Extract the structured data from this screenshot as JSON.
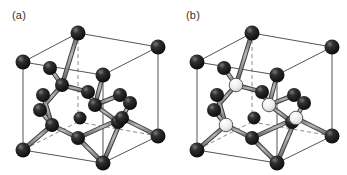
{
  "figure": {
    "type": "crystal-structure-diagram",
    "background_color": "#ffffff",
    "width": 347,
    "height": 175,
    "panels": [
      {
        "id": "a",
        "label": "(a)",
        "structure_name": "diamond cubic",
        "atom_types": [
          "dark"
        ],
        "description": "Conventional cubic unit cell with all atoms identical (dark spheres), four internal tetrahedral-site atoms bonded to corner and face-centre atoms."
      },
      {
        "id": "b",
        "label": "(b)",
        "structure_name": "zincblende",
        "atom_types": [
          "dark",
          "light"
        ],
        "description": "Conventional cubic unit cell with two species; light spheres occupy the four internal tetrahedral sites, dark spheres occupy corners and face centres."
      }
    ]
  },
  "style": {
    "cell_edge_color": "#555555",
    "cell_edge_hidden_color": "#888888",
    "bond_color": "#4a4a4a",
    "bond_fill": "#9a9a9a",
    "atom_dark_color": "#111111",
    "atom_dark_highlight": "#666666",
    "atom_light_color": "#e8e8e8",
    "atom_light_edge": "#4a4a4a",
    "label_color": "#333333"
  },
  "geometry": {
    "cube_vertices": {
      "front_bottom_left": [
        23,
        150
      ],
      "front_bottom_right": [
        103,
        163
      ],
      "front_top_left": [
        23,
        62
      ],
      "front_top_right": [
        103,
        75
      ],
      "back_bottom_left": [
        78,
        122
      ],
      "back_bottom_right": [
        158,
        136
      ],
      "back_top_left": [
        78,
        33
      ],
      "back_top_right": [
        158,
        47
      ]
    },
    "atom_count_dark_panel_a": 18,
    "atom_count_dark_panel_b": 14,
    "atom_count_light_panel_b": 4
  }
}
